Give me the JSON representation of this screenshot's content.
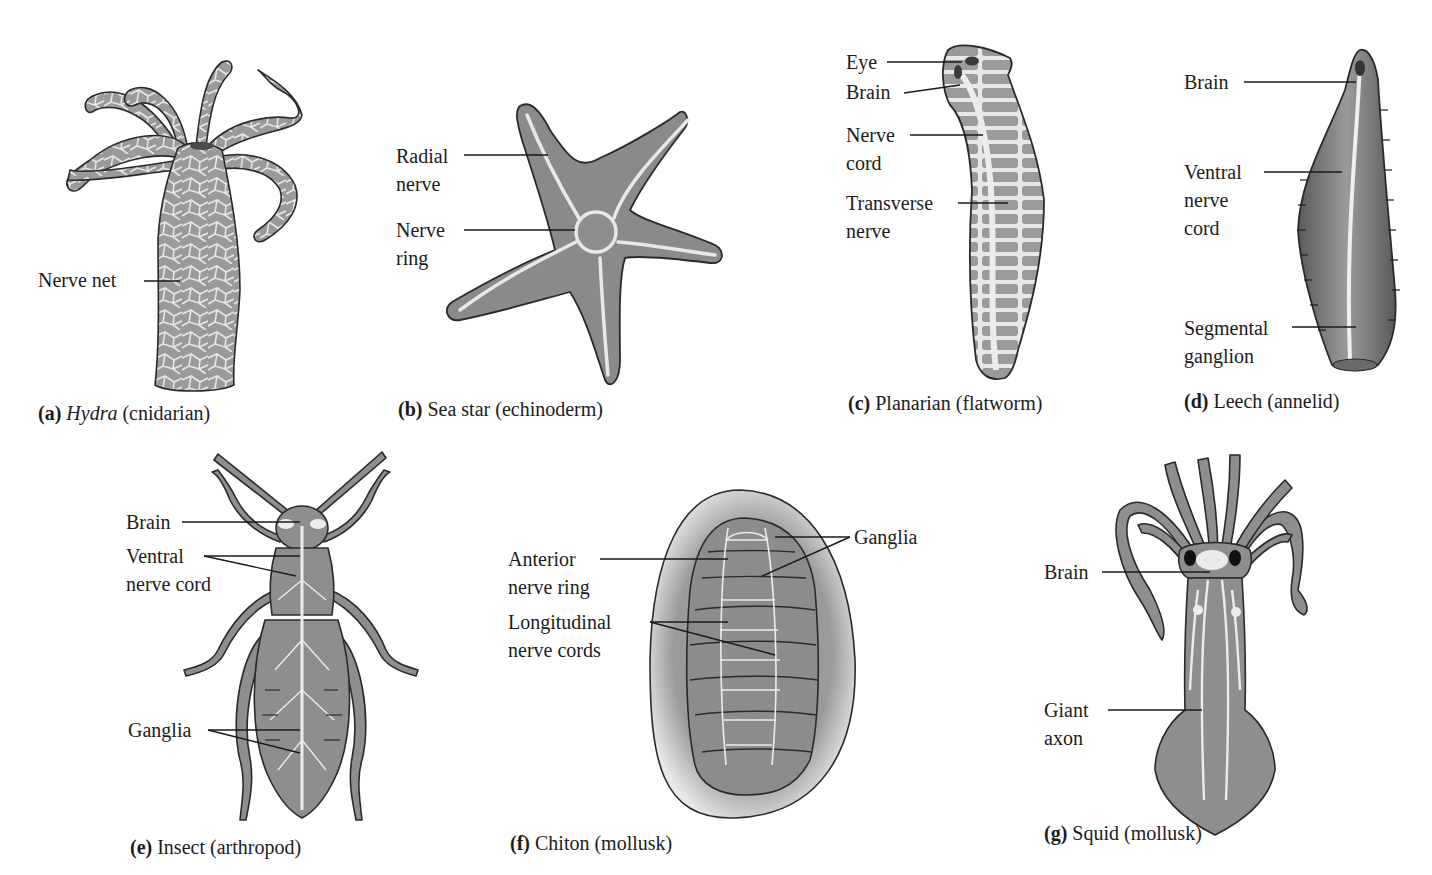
{
  "figure": {
    "colors": {
      "background": "#ffffff",
      "body_fill": "#8f8f8f",
      "body_fill_light": "#a9a9a9",
      "nerve": "#ececec",
      "outline": "#2a2a2a",
      "text": "#1c1c1c"
    }
  },
  "panels": [
    {
      "id": "a",
      "letter": "(a)",
      "name": "Hydra",
      "name_italic": true,
      "group": "(cnidarian)",
      "labels": [
        {
          "text": "Nerve net"
        }
      ]
    },
    {
      "id": "b",
      "letter": "(b)",
      "name": "Sea star",
      "group": "(echinoderm)",
      "labels": [
        {
          "line1": "Radial",
          "line2": "nerve"
        },
        {
          "line1": "Nerve",
          "line2": "ring"
        }
      ]
    },
    {
      "id": "c",
      "letter": "(c)",
      "name": "Planarian",
      "group": "(flatworm)",
      "labels": [
        {
          "line1": "Eye"
        },
        {
          "line1": "Brain"
        },
        {
          "line1": "Nerve",
          "line2": "cord"
        },
        {
          "line1": "Transverse",
          "line2": "nerve"
        }
      ]
    },
    {
      "id": "d",
      "letter": "(d)",
      "name": "Leech",
      "group": "(annelid)",
      "labels": [
        {
          "line1": "Brain"
        },
        {
          "line1": "Ventral",
          "line2": "nerve",
          "line3": "cord"
        },
        {
          "line1": "Segmental",
          "line2": "ganglion"
        }
      ]
    },
    {
      "id": "e",
      "letter": "(e)",
      "name": "Insect",
      "group": "(arthropod)",
      "labels": [
        {
          "line1": "Brain"
        },
        {
          "line1": "Ventral",
          "line2": "nerve cord"
        },
        {
          "line1": "Ganglia"
        }
      ]
    },
    {
      "id": "f",
      "letter": "(f)",
      "name": "Chiton",
      "group": "(mollusk)",
      "labels": [
        {
          "line1": "Anterior",
          "line2": "nerve ring"
        },
        {
          "line1": "Longitudinal",
          "line2": "nerve cords"
        },
        {
          "line1": "Ganglia"
        }
      ]
    },
    {
      "id": "g",
      "letter": "(g)",
      "name": "Squid",
      "group": "(mollusk)",
      "labels": [
        {
          "line1": "Brain"
        },
        {
          "line1": "Giant",
          "line2": "axon"
        }
      ]
    }
  ]
}
